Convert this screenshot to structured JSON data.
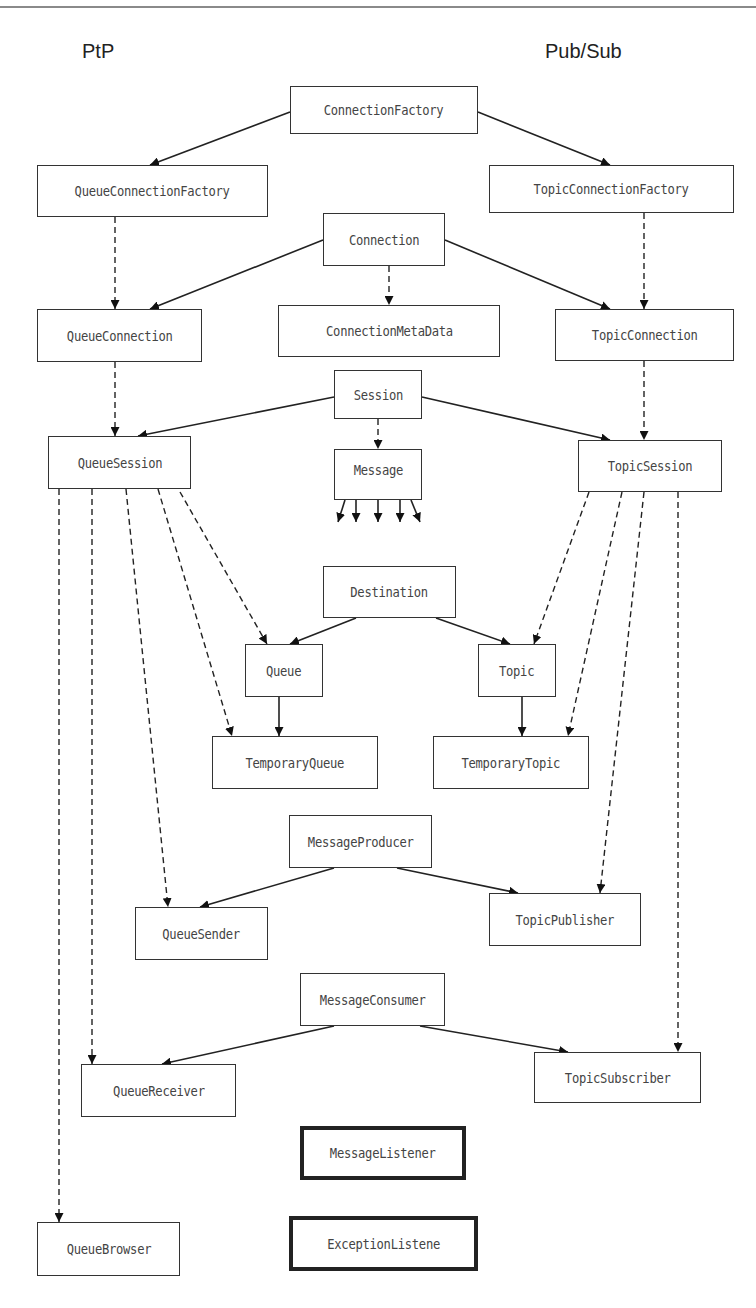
{
  "labels": {
    "left": "PtP",
    "right": "Pub/Sub"
  },
  "nodes": {
    "connection_factory": "ConnectionFactory",
    "queue_connection_factory": "QueueConnectionFactory",
    "topic_connection_factory": "TopicConnectionFactory",
    "connection": "Connection",
    "queue_connection": "QueueConnection",
    "connection_meta_data": "ConnectionMetaData",
    "topic_connection": "TopicConnection",
    "session": "Session",
    "queue_session": "QueueSession",
    "message": "Message",
    "topic_session": "TopicSession",
    "destination": "Destination",
    "queue": "Queue",
    "topic": "Topic",
    "temporary_queue": "TemporaryQueue",
    "temporary_topic": "TemporaryTopic",
    "message_producer": "MessageProducer",
    "queue_sender": "QueueSender",
    "topic_publisher": "TopicPublisher",
    "message_consumer": "MessageConsumer",
    "queue_receiver": "QueueReceiver",
    "topic_subscriber": "TopicSubscriber",
    "message_listener": "MessageListener",
    "queue_browser": "QueueBrowser",
    "exception_listener": "ExceptionListene"
  },
  "edges": {
    "inheritance_solid": [
      [
        "ConnectionFactory",
        "QueueConnectionFactory"
      ],
      [
        "ConnectionFactory",
        "TopicConnectionFactory"
      ],
      [
        "Connection",
        "QueueConnection"
      ],
      [
        "Connection",
        "TopicConnection"
      ],
      [
        "Session",
        "QueueSession"
      ],
      [
        "Session",
        "TopicSession"
      ],
      [
        "Destination",
        "Queue"
      ],
      [
        "Destination",
        "Topic"
      ],
      [
        "Queue",
        "TemporaryQueue"
      ],
      [
        "Topic",
        "TemporaryTopic"
      ],
      [
        "MessageProducer",
        "QueueSender"
      ],
      [
        "MessageProducer",
        "TopicPublisher"
      ],
      [
        "MessageConsumer",
        "QueueReceiver"
      ],
      [
        "MessageConsumer",
        "TopicSubscriber"
      ]
    ],
    "creates_dashed": [
      [
        "QueueConnectionFactory",
        "QueueConnection"
      ],
      [
        "TopicConnectionFactory",
        "TopicConnection"
      ],
      [
        "Connection",
        "ConnectionMetaData"
      ],
      [
        "QueueConnection",
        "QueueSession"
      ],
      [
        "TopicConnection",
        "TopicSession"
      ],
      [
        "Session",
        "Message"
      ],
      [
        "QueueSession",
        "Queue"
      ],
      [
        "QueueSession",
        "TemporaryQueue"
      ],
      [
        "QueueSession",
        "QueueSender"
      ],
      [
        "QueueSession",
        "QueueReceiver"
      ],
      [
        "QueueSession",
        "QueueBrowser"
      ],
      [
        "TopicSession",
        "Topic"
      ],
      [
        "TopicSession",
        "TemporaryTopic"
      ],
      [
        "TopicSession",
        "TopicPublisher"
      ],
      [
        "TopicSession",
        "TopicSubscriber"
      ]
    ]
  },
  "colors": {
    "line": "#222222",
    "text": "#444444",
    "rule": "#8a8a8a"
  }
}
